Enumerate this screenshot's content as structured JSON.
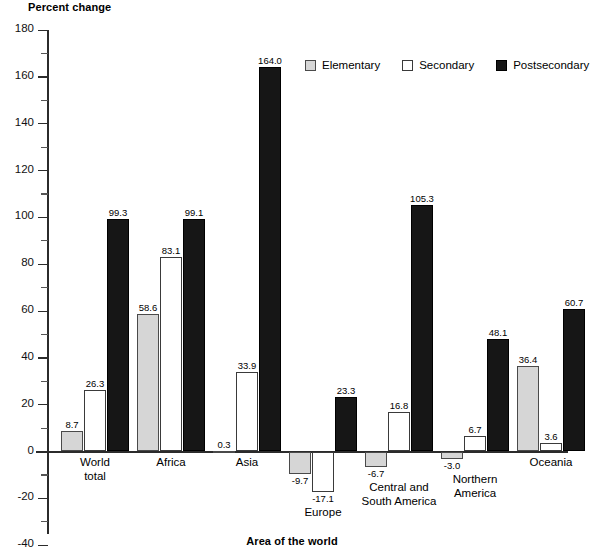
{
  "chart_data": {
    "type": "bar",
    "title": "",
    "ylabel": "Percent change",
    "xlabel": "Area of the world",
    "ylim": [
      -40,
      180
    ],
    "ytick_step": 20,
    "minor_ticks": true,
    "grid": false,
    "legend_position": "top-right",
    "categories": [
      "World total",
      "Africa",
      "Asia",
      "Europe",
      "Central and South America",
      "Northern America",
      "Oceania"
    ],
    "category_lines": [
      [
        "World",
        "total"
      ],
      [
        "Africa"
      ],
      [
        "Asia"
      ],
      [
        "Europe"
      ],
      [
        "Central and",
        "South America"
      ],
      [
        "Northern",
        "America"
      ],
      [
        "Oceania"
      ]
    ],
    "series": [
      {
        "name": "Elementary",
        "color": "#d6d6d6",
        "values": [
          8.7,
          58.6,
          0.3,
          -9.7,
          -6.7,
          -3.0,
          36.4
        ],
        "labels": [
          "8.7",
          "58.6",
          "0.3",
          "-9.7",
          "-6.7",
          "-3.0",
          "36.4"
        ]
      },
      {
        "name": "Secondary",
        "color": "#ffffff",
        "values": [
          26.3,
          83.1,
          33.9,
          -17.1,
          16.8,
          6.7,
          3.6
        ],
        "labels": [
          "26.3",
          "83.1",
          "33.9",
          "-17.1",
          "16.8",
          "6.7",
          "3.6"
        ]
      },
      {
        "name": "Postsecondary",
        "color": "#161616",
        "values": [
          99.3,
          99.1,
          164.0,
          23.3,
          105.3,
          48.1,
          60.7
        ],
        "labels": [
          "99.3",
          "99.1",
          "164.0",
          "23.3",
          "105.3",
          "48.1",
          "60.7"
        ]
      }
    ],
    "ytick_labels": [
      "180",
      "160",
      "140",
      "120",
      "100",
      "80",
      "60",
      "40",
      "20",
      "0",
      "-20",
      "-40"
    ],
    "ytick_values": [
      180,
      160,
      140,
      120,
      100,
      80,
      60,
      40,
      20,
      0,
      -20,
      -40
    ]
  },
  "legend": {
    "items": [
      {
        "label": "Elementary",
        "key": "elementary"
      },
      {
        "label": "Secondary",
        "key": "secondary"
      },
      {
        "label": "Postsecondary",
        "key": "postsecondary"
      }
    ]
  }
}
